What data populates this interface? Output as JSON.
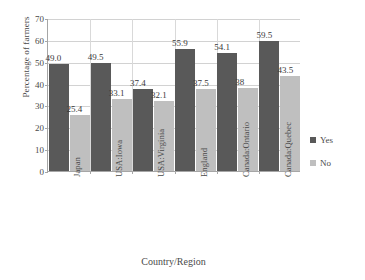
{
  "chart_data": {
    "type": "bar",
    "title": "",
    "xlabel": "Country/Region",
    "ylabel": "Percentage of farmers",
    "categories": [
      "Japan",
      "USA:Iowa",
      "USA:Virginia",
      "England",
      "Canada:Ontario",
      "Canada:Quebec"
    ],
    "series": [
      {
        "name": "Yes",
        "color": "#595959",
        "values": [
          49.0,
          49.5,
          37.4,
          55.9,
          54.1,
          59.5
        ],
        "labels": [
          "49.0",
          "49.5",
          "37.4",
          "55.9",
          "54.1",
          "59.5"
        ]
      },
      {
        "name": "No",
        "color": "#bfbfbf",
        "values": [
          25.4,
          33.1,
          32.1,
          37.5,
          38.0,
          43.5
        ],
        "labels": [
          "25.4",
          "33.1",
          "32.1",
          "37.5",
          "38",
          "43.5"
        ]
      }
    ],
    "ylim": [
      0,
      70
    ],
    "yticks": [
      "0",
      "10",
      "20",
      "30",
      "40",
      "50",
      "60",
      "70"
    ],
    "grid": true,
    "legend_position": "right"
  }
}
